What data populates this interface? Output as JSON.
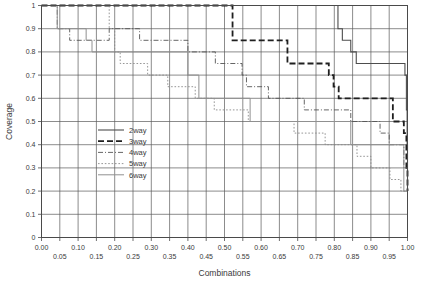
{
  "chart_data": {
    "type": "line",
    "title": "",
    "xlabel": "Combinations",
    "ylabel": "Coverage",
    "xlim": [
      0.0,
      1.0
    ],
    "ylim": [
      0.0,
      1.0
    ],
    "grid": true,
    "legend_position": "inside-left-middle",
    "x_tick_labels": [
      "0.00",
      "0.05",
      "0.10",
      "0.15",
      "0.20",
      "0.25",
      "0.30",
      "0.35",
      "0.40",
      "0.45",
      "0.50",
      "0.55",
      "0.60",
      "0.65",
      "0.70",
      "0.75",
      "0.80",
      "0.85",
      "0.90",
      "0.95",
      "1.00"
    ],
    "x_tick_values": [
      0.0,
      0.05,
      0.1,
      0.15,
      0.2,
      0.25,
      0.3,
      0.35,
      0.4,
      0.45,
      0.5,
      0.55,
      0.6,
      0.65,
      0.7,
      0.75,
      0.8,
      0.85,
      0.9,
      0.95,
      1.0
    ],
    "y_tick_labels": [
      "0",
      "0.1",
      "0.2",
      "0.3",
      "0.4",
      "0.5",
      "0.6",
      "0.7",
      "0.8",
      "0.9",
      "1"
    ],
    "y_tick_values": [
      0,
      0.1,
      0.2,
      0.3,
      0.4,
      0.5,
      0.6,
      0.7,
      0.8,
      0.9,
      1.0
    ],
    "series": [
      {
        "name": "2way",
        "style": "solid",
        "color": "#4d4d4d",
        "width": 1.1,
        "dash": "",
        "points": [
          [
            0.0,
            1.0
          ],
          [
            0.81,
            1.0
          ],
          [
            0.81,
            0.9
          ],
          [
            0.822,
            0.9
          ],
          [
            0.822,
            0.85
          ],
          [
            0.845,
            0.85
          ],
          [
            0.845,
            0.8
          ],
          [
            0.86,
            0.8
          ],
          [
            0.86,
            0.75
          ],
          [
            0.993,
            0.75
          ],
          [
            0.993,
            0.7
          ],
          [
            0.997,
            0.7
          ],
          [
            0.997,
            0.55
          ],
          [
            0.999,
            0.55
          ],
          [
            0.999,
            0.4
          ],
          [
            1.0,
            0.4
          ],
          [
            1.0,
            0.2
          ]
        ]
      },
      {
        "name": "3way",
        "style": "dashed",
        "color": "#1f1f1f",
        "width": 1.8,
        "dash": "6,3",
        "points": [
          [
            0.0,
            1.0
          ],
          [
            0.522,
            1.0
          ],
          [
            0.522,
            0.85
          ],
          [
            0.672,
            0.85
          ],
          [
            0.672,
            0.75
          ],
          [
            0.785,
            0.75
          ],
          [
            0.785,
            0.7
          ],
          [
            0.798,
            0.7
          ],
          [
            0.798,
            0.65
          ],
          [
            0.812,
            0.65
          ],
          [
            0.812,
            0.6
          ],
          [
            0.96,
            0.6
          ],
          [
            0.96,
            0.5
          ],
          [
            0.99,
            0.5
          ],
          [
            0.99,
            0.45
          ],
          [
            0.997,
            0.45
          ],
          [
            0.997,
            0.3
          ],
          [
            1.0,
            0.3
          ],
          [
            1.0,
            0.2
          ]
        ]
      },
      {
        "name": "4way",
        "style": "dash-dot",
        "color": "#555555",
        "width": 0.9,
        "dash": "5,2,1,2",
        "points": [
          [
            0.0,
            1.0
          ],
          [
            0.043,
            1.0
          ],
          [
            0.043,
            0.9
          ],
          [
            0.077,
            0.9
          ],
          [
            0.077,
            0.85
          ],
          [
            0.185,
            0.85
          ],
          [
            0.185,
            0.9
          ],
          [
            0.268,
            0.9
          ],
          [
            0.268,
            0.85
          ],
          [
            0.4,
            0.85
          ],
          [
            0.4,
            0.8
          ],
          [
            0.475,
            0.8
          ],
          [
            0.475,
            0.75
          ],
          [
            0.548,
            0.75
          ],
          [
            0.548,
            0.7
          ],
          [
            0.56,
            0.7
          ],
          [
            0.56,
            0.65
          ],
          [
            0.62,
            0.65
          ],
          [
            0.62,
            0.6
          ],
          [
            0.718,
            0.6
          ],
          [
            0.718,
            0.55
          ],
          [
            0.845,
            0.55
          ],
          [
            0.845,
            0.5
          ],
          [
            0.925,
            0.5
          ],
          [
            0.925,
            0.45
          ],
          [
            0.95,
            0.45
          ],
          [
            0.95,
            0.4
          ],
          [
            0.99,
            0.4
          ],
          [
            0.99,
            0.3
          ],
          [
            1.0,
            0.3
          ],
          [
            1.0,
            0.2
          ]
        ]
      },
      {
        "name": "5way",
        "style": "dotted",
        "color": "#8a8a8a",
        "width": 0.9,
        "dash": "1.6,1.8",
        "points": [
          [
            0.0,
            1.0
          ],
          [
            0.185,
            1.0
          ],
          [
            0.185,
            0.9
          ],
          [
            0.2,
            0.9
          ],
          [
            0.2,
            0.8
          ],
          [
            0.215,
            0.8
          ],
          [
            0.215,
            0.75
          ],
          [
            0.29,
            0.75
          ],
          [
            0.29,
            0.7
          ],
          [
            0.345,
            0.7
          ],
          [
            0.345,
            0.65
          ],
          [
            0.42,
            0.65
          ],
          [
            0.42,
            0.6
          ],
          [
            0.472,
            0.6
          ],
          [
            0.472,
            0.55
          ],
          [
            0.565,
            0.55
          ],
          [
            0.565,
            0.5
          ],
          [
            0.69,
            0.5
          ],
          [
            0.69,
            0.45
          ],
          [
            0.775,
            0.45
          ],
          [
            0.775,
            0.4
          ],
          [
            0.862,
            0.4
          ],
          [
            0.862,
            0.35
          ],
          [
            0.9,
            0.35
          ],
          [
            0.9,
            0.3
          ],
          [
            0.952,
            0.3
          ],
          [
            0.952,
            0.25
          ],
          [
            0.982,
            0.25
          ],
          [
            0.982,
            0.2
          ],
          [
            1.0,
            0.2
          ]
        ]
      },
      {
        "name": "6way",
        "style": "solid",
        "color": "#909090",
        "width": 1.0,
        "dash": "",
        "points": [
          [
            0.0,
            1.0
          ],
          [
            0.043,
            1.0
          ],
          [
            0.043,
            0.9
          ],
          [
            0.122,
            0.9
          ],
          [
            0.122,
            0.85
          ],
          [
            0.138,
            0.85
          ],
          [
            0.138,
            0.8
          ],
          [
            0.4,
            0.8
          ],
          [
            0.4,
            0.7
          ],
          [
            0.43,
            0.7
          ],
          [
            0.43,
            0.6
          ],
          [
            0.57,
            0.6
          ],
          [
            0.57,
            0.5
          ],
          [
            0.845,
            0.5
          ],
          [
            0.845,
            0.4
          ],
          [
            0.99,
            0.4
          ],
          [
            0.99,
            0.2
          ],
          [
            1.0,
            0.2
          ]
        ]
      }
    ]
  },
  "legend": {
    "items": [
      {
        "label": "2way"
      },
      {
        "label": "3way"
      },
      {
        "label": "4way"
      },
      {
        "label": "5way"
      },
      {
        "label": "6way"
      }
    ]
  }
}
